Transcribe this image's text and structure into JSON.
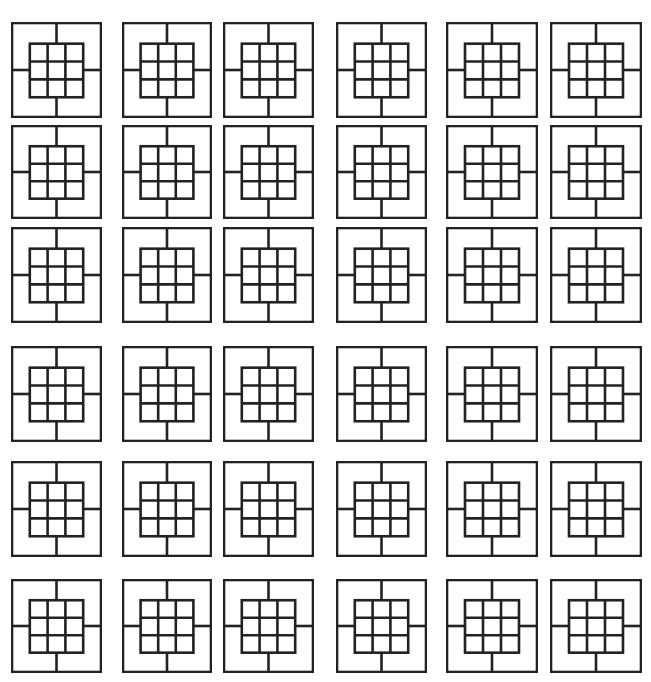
{
  "figure": {
    "rows": 6,
    "cols": 6,
    "stroke_color": "#222222",
    "background_color": "#ffffff",
    "col_x": [
      12,
      123,
      224,
      337,
      447,
      551
    ],
    "col_w": [
      89,
      88,
      89,
      89,
      90,
      90
    ],
    "row_y": [
      23,
      126,
      228,
      347,
      462,
      580
    ],
    "row_h": [
      94,
      92,
      94,
      94,
      94,
      92
    ],
    "tile": {
      "outer_square": true,
      "spokes": [
        "top",
        "right",
        "bottom",
        "left"
      ],
      "inner_grid": {
        "rows": 3,
        "cols": 3,
        "inset_x_frac": 0.2,
        "inset_top_frac": 0.22,
        "inset_bottom_frac": 0.21
      }
    }
  }
}
